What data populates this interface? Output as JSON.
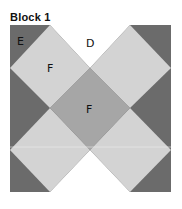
{
  "title": "Block 1",
  "colors": {
    "dark": "#6b6b6b",
    "light": "#d3d3d3",
    "medium": "#a6a6a6",
    "white": "#ffffff"
  },
  "pieces": {
    "corner_label": "E",
    "edge_label": "D",
    "diamond_label": "F",
    "center_label": "F"
  }
}
